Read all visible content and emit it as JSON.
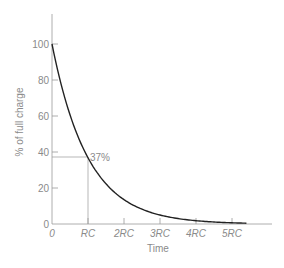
{
  "chart_data": {
    "type": "line",
    "title": "",
    "xlabel": "Time",
    "ylabel": "% of full charge",
    "x_ticks": [
      "0",
      "RC",
      "2RC",
      "3RC",
      "4RC",
      "5RC"
    ],
    "y_ticks": [
      "0",
      "20",
      "40",
      "60",
      "80",
      "100"
    ],
    "ylim": [
      0,
      100
    ],
    "xlim": [
      0,
      5.5
    ],
    "grid": false,
    "series": [
      {
        "name": "Capacitor discharge",
        "x": [
          0,
          0.5,
          1,
          1.5,
          2,
          2.5,
          3,
          3.5,
          4,
          4.5,
          5,
          5.4
        ],
        "values": [
          100,
          60.7,
          36.8,
          22.3,
          13.5,
          8.2,
          5.0,
          3.0,
          1.8,
          1.1,
          0.7,
          0.5
        ]
      }
    ],
    "annotations": [
      {
        "text": "37%",
        "x": 1,
        "y": 37,
        "note": "guide lines drop from curve at t=RC to both axes"
      }
    ],
    "colors": {
      "curve": "#222222",
      "axes": "#8a8a8a",
      "text": "#8a8a8a"
    }
  }
}
